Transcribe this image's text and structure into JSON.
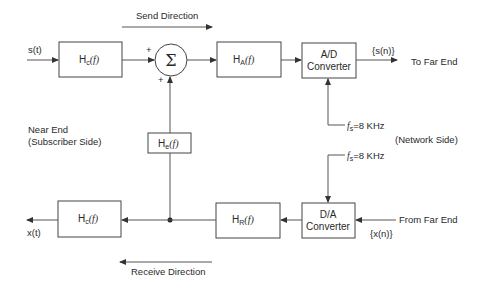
{
  "diagram": {
    "labels": {
      "send_direction": "Send Direction",
      "receive_direction": "Receive Direction",
      "input_signal": "s(t)",
      "output_signal": "x(t)",
      "near_end_line1": "Near End",
      "near_end_line2": "(Subscriber Side)",
      "network_side": "(Network Side)",
      "to_far_end": "To Far End",
      "from_far_end": "From Far End",
      "sn": "{s(n)}",
      "xn": "{x(n)}",
      "plus_top": "+",
      "plus_bottom": "+",
      "sigma": "Σ"
    },
    "sampling": {
      "fs_symbol": "f",
      "fs_sub": "s",
      "fs_value": "=8 KHz"
    },
    "blocks": {
      "hc_send": {
        "main": "H",
        "sub": "c",
        "arg": "(f)"
      },
      "ha": {
        "main": "H",
        "sub": "A",
        "arg": "(f)"
      },
      "ad": {
        "line1": "A/D",
        "line2": "Converter"
      },
      "he": {
        "main": "H",
        "sub": "e",
        "arg": "(f)"
      },
      "hc_recv": {
        "main": "H",
        "sub": "c",
        "arg": "(f)"
      },
      "hr": {
        "main": "H",
        "sub": "R",
        "arg": "(f)"
      },
      "da": {
        "line1": "D/A",
        "line2": "Converter"
      }
    }
  }
}
